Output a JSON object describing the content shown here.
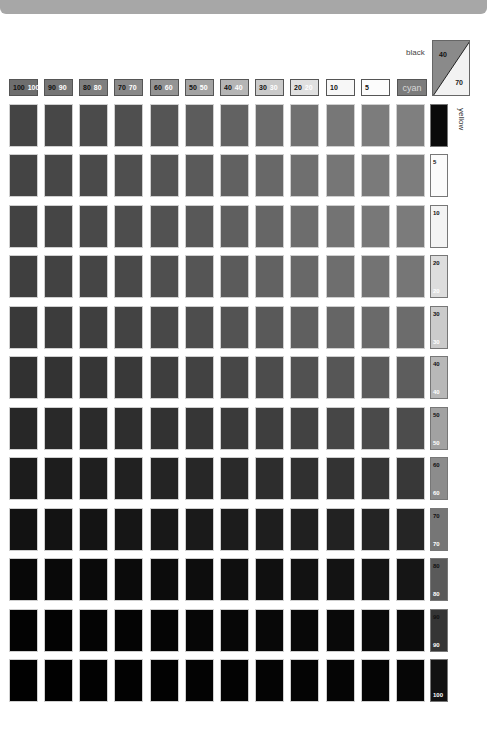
{
  "chart_labels": {
    "black_axis": "black",
    "cyan_axis": "cyan",
    "yellow_axis": "yellow",
    "key_swatch": {
      "top_value": "40",
      "bottom_value": "70"
    }
  },
  "header_swatches": [
    {
      "a": "100",
      "b": "100",
      "bg": "#6e6e6e"
    },
    {
      "a": "90",
      "b": "90",
      "bg": "#767676"
    },
    {
      "a": "80",
      "b": "80",
      "bg": "#7f7f7f"
    },
    {
      "a": "70",
      "b": "70",
      "bg": "#898989"
    },
    {
      "a": "60",
      "b": "60",
      "bg": "#949494"
    },
    {
      "a": "50",
      "b": "50",
      "bg": "#a3a3a3"
    },
    {
      "a": "40",
      "b": "40",
      "bg": "#b5b5b5"
    },
    {
      "a": "30",
      "b": "30",
      "bg": "#cacaca"
    },
    {
      "a": "20",
      "b": "20",
      "bg": "#e0e0e0"
    },
    {
      "a": "10",
      "b": "",
      "bg": "#f7f7f7"
    },
    {
      "a": "5",
      "b": "",
      "bg": "#fcfcfc"
    }
  ],
  "yellow_swatches": [
    {
      "a": "",
      "b": "",
      "bg": "#0a0a0a"
    },
    {
      "a": "5",
      "b": "",
      "bg": "#fbfbfb"
    },
    {
      "a": "10",
      "b": "",
      "bg": "#f3f3f3"
    },
    {
      "a": "20",
      "b": "20",
      "bg": "#dddddd"
    },
    {
      "a": "30",
      "b": "30",
      "bg": "#cbcbcb"
    },
    {
      "a": "40",
      "b": "40",
      "bg": "#b8b8b8"
    },
    {
      "a": "50",
      "b": "50",
      "bg": "#a2a2a2"
    },
    {
      "a": "60",
      "b": "60",
      "bg": "#8c8c8c"
    },
    {
      "a": "70",
      "b": "70",
      "bg": "#767676"
    },
    {
      "a": "80",
      "b": "80",
      "bg": "#5a5a5a"
    },
    {
      "a": "90",
      "b": "90",
      "bg": "#353535"
    },
    {
      "a": "",
      "b": "100",
      "bg": "#111111"
    }
  ],
  "grid": {
    "columns": [
      "100",
      "90",
      "80",
      "70",
      "60",
      "50",
      "40",
      "30",
      "20",
      "10",
      "5",
      "cyan"
    ],
    "rows": [
      "0",
      "5",
      "10",
      "20",
      "30",
      "40",
      "50",
      "60",
      "70",
      "80",
      "90",
      "100"
    ],
    "col_x": [
      9,
      44,
      79,
      114,
      150,
      185,
      220,
      255,
      290,
      326,
      361,
      396
    ],
    "row_y": [
      104,
      154,
      205,
      255,
      306,
      356,
      407,
      457,
      508,
      558,
      609,
      659
    ],
    "colors": [
      [
        "#444444",
        "#474747",
        "#4b4b4b",
        "#4f4f4f",
        "#555555",
        "#5c5c5c",
        "#626262",
        "#6a6a6a",
        "#717171",
        "#777777",
        "#7c7c7c",
        "#7f7f7f"
      ],
      [
        "#444444",
        "#474747",
        "#4a4a4a",
        "#4f4f4f",
        "#545454",
        "#5a5a5a",
        "#616161",
        "#686868",
        "#6f6f6f",
        "#767676",
        "#7a7a7a",
        "#7d7d7d"
      ],
      [
        "#424242",
        "#454545",
        "#494949",
        "#4d4d4d",
        "#525252",
        "#585858",
        "#5f5f5f",
        "#666666",
        "#6d6d6d",
        "#737373",
        "#787878",
        "#7b7b7b"
      ],
      [
        "#3f3f3f",
        "#424242",
        "#454545",
        "#494949",
        "#4f4f4f",
        "#555555",
        "#5b5b5b",
        "#626262",
        "#686868",
        "#6e6e6e",
        "#737373",
        "#767676"
      ],
      [
        "#393939",
        "#3c3c3c",
        "#3f3f3f",
        "#434343",
        "#484848",
        "#4d4d4d",
        "#535353",
        "#595959",
        "#5f5f5f",
        "#656565",
        "#6a6a6a",
        "#6c6c6c"
      ],
      [
        "#313131",
        "#333333",
        "#363636",
        "#393939",
        "#3e3e3e",
        "#424242",
        "#474747",
        "#4c4c4c",
        "#515151",
        "#565656",
        "#5b5b5b",
        "#5d5d5d"
      ],
      [
        "#272727",
        "#292929",
        "#2b2b2b",
        "#2e2e2e",
        "#323232",
        "#363636",
        "#3a3a3a",
        "#3e3e3e",
        "#424242",
        "#464646",
        "#4a4a4a",
        "#4c4c4c"
      ],
      [
        "#1c1c1c",
        "#1d1d1d",
        "#1f1f1f",
        "#212121",
        "#242424",
        "#272727",
        "#2a2a2a",
        "#2d2d2d",
        "#303030",
        "#333333",
        "#363636",
        "#383838"
      ],
      [
        "#121212",
        "#131313",
        "#141414",
        "#161616",
        "#181818",
        "#1a1a1a",
        "#1c1c1c",
        "#1e1e1e",
        "#202020",
        "#222222",
        "#242424",
        "#252525"
      ],
      [
        "#080808",
        "#090909",
        "#0a0a0a",
        "#0b0b0b",
        "#0c0c0c",
        "#0d0d0d",
        "#0f0f0f",
        "#101010",
        "#121212",
        "#131313",
        "#141414",
        "#151515"
      ],
      [
        "#030303",
        "#030303",
        "#040404",
        "#040404",
        "#050505",
        "#060606",
        "#070707",
        "#080808",
        "#080808",
        "#090909",
        "#0a0a0a",
        "#0b0b0b"
      ],
      [
        "#010101",
        "#010101",
        "#020202",
        "#020202",
        "#020202",
        "#030303",
        "#030303",
        "#040404",
        "#040404",
        "#050505",
        "#050505",
        "#060606"
      ]
    ]
  },
  "colors": {
    "topbar": "#a7a7a7",
    "cyan_swatch": "#7c7c7c",
    "triangle_dark": "#8a8a8a",
    "triangle_light": "#f2f2f2"
  }
}
